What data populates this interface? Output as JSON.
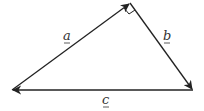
{
  "diagram": {
    "type": "vector-triangle",
    "vertices": {
      "left": [
        12,
        90
      ],
      "top": [
        130,
        3
      ],
      "right": [
        193,
        90
      ]
    },
    "vectors": [
      {
        "name": "a",
        "from": "left",
        "to": "top",
        "label": "a"
      },
      {
        "name": "b",
        "from": "top",
        "to": "right",
        "label": "b"
      },
      {
        "name": "c",
        "from": "right",
        "to": "left",
        "label": "c"
      }
    ],
    "right_angle_at": "top",
    "line_color": "#222222"
  },
  "labels": {
    "a": "a",
    "b": "b",
    "c": "c"
  }
}
